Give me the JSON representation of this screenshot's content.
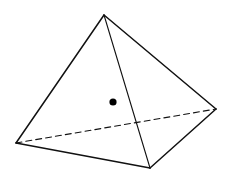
{
  "diagram": {
    "type": "tetrahedron",
    "background": "#ffffff",
    "stroke_color": "#111111",
    "vertices": {
      "apex": [
        104,
        15
      ],
      "left": [
        16,
        143
      ],
      "right": [
        216,
        109
      ],
      "bottom": [
        150,
        168
      ]
    },
    "edges": [
      {
        "name": "apex-left",
        "from": "apex",
        "to": "left",
        "style": "solid",
        "width": 1.5
      },
      {
        "name": "apex-right",
        "from": "apex",
        "to": "right",
        "style": "solid",
        "width": 1.5
      },
      {
        "name": "apex-bottom",
        "from": "apex",
        "to": "bottom",
        "style": "solid",
        "width": 1.1
      },
      {
        "name": "left-bottom",
        "from": "left",
        "to": "bottom",
        "style": "solid",
        "width": 1.5
      },
      {
        "name": "right-bottom",
        "from": "right",
        "to": "bottom",
        "style": "solid",
        "width": 1.5
      },
      {
        "name": "left-right",
        "from": "left",
        "to": "right",
        "style": "dashed",
        "width": 1.1,
        "dash": "6 4"
      }
    ],
    "point": {
      "x": 113,
      "y": 102,
      "r": 3.6,
      "color": "#000000"
    }
  }
}
